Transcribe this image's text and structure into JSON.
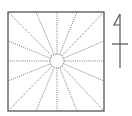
{
  "diagram": {
    "type": "radial-plan",
    "square": {
      "x": 8,
      "y": 12,
      "width": 96,
      "height": 99
    },
    "center_circle": {
      "cx": 57,
      "cy": 61,
      "r": 7
    },
    "ray_endpoints": [
      [
        8,
        12
      ],
      [
        36,
        12
      ],
      [
        57,
        12
      ],
      [
        77,
        12
      ],
      [
        104,
        12
      ],
      [
        104,
        41
      ],
      [
        104,
        61
      ],
      [
        104,
        81
      ],
      [
        104,
        111
      ],
      [
        77,
        111
      ],
      [
        57,
        111
      ],
      [
        36,
        111
      ],
      [
        8,
        111
      ],
      [
        8,
        81
      ],
      [
        8,
        61
      ],
      [
        8,
        41
      ]
    ],
    "north_arrow": {
      "x": 120,
      "top": 14,
      "bottom": 68
    },
    "colors": {
      "line": "#555555",
      "dotted": "#777777",
      "background": "#ffffff"
    }
  }
}
